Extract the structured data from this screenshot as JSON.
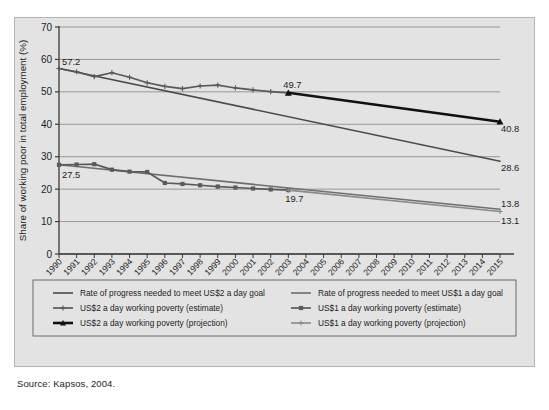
{
  "source_note": "Source: Kapsos, 2004.",
  "chart_data": {
    "type": "line",
    "title": "",
    "xlabel": "",
    "ylabel": "Share of working poor in total employment (%)",
    "xlim": [
      1990,
      2015
    ],
    "ylim": [
      0,
      70
    ],
    "yticks": [
      0,
      10,
      20,
      30,
      40,
      50,
      60,
      70
    ],
    "ytick_labels": [
      "0",
      "10",
      "20",
      "30",
      "40",
      "50",
      "60",
      "70"
    ],
    "grid": "horizontal",
    "legend_position": "below-plot",
    "x": [
      1990,
      1991,
      1992,
      1993,
      1994,
      1995,
      1996,
      1997,
      1998,
      1999,
      2000,
      2001,
      2002,
      2003,
      2004,
      2005,
      2006,
      2007,
      2008,
      2009,
      2010,
      2011,
      2012,
      2013,
      2014,
      2015
    ],
    "xtick_labels": [
      "1990",
      "1991",
      "1992",
      "1993",
      "1994",
      "1995",
      "1996",
      "1997",
      "1998",
      "1999",
      "2000",
      "2001",
      "2002",
      "2003",
      "2004",
      "2005",
      "2006",
      "2007",
      "2008",
      "2009",
      "2010",
      "2011",
      "2012",
      "2013",
      "2014",
      "2015"
    ],
    "series": [
      {
        "name": "Rate of progress needed to meet US$2 a day goal",
        "key": "goal_us2",
        "color": "#4a4a4a",
        "marker": "none",
        "width": 1.6,
        "x": [
          1990,
          2015
        ],
        "values": [
          57.2,
          28.6
        ]
      },
      {
        "name": "Rate of progress needed to meet US$1 a day goal",
        "key": "goal_us1",
        "color": "#6e6e6e",
        "marker": "none",
        "width": 1.6,
        "x": [
          1990,
          2015
        ],
        "values": [
          27.5,
          13.8
        ]
      },
      {
        "name": "US$2 a day working poverty (estimate)",
        "key": "est_us2",
        "color": "#585858",
        "marker": "plus",
        "width": 1.7,
        "x": [
          1990,
          1991,
          1992,
          1993,
          1994,
          1995,
          1996,
          1997,
          1998,
          1999,
          2000,
          2001,
          2002,
          2003
        ],
        "values": [
          57.2,
          56.2,
          54.7,
          55.9,
          54.5,
          52.8,
          51.7,
          51.0,
          51.8,
          52.1,
          51.2,
          50.6,
          50.1,
          49.7
        ]
      },
      {
        "name": "US$2 a day working poverty (projection)",
        "key": "proj_us2",
        "color": "#101010",
        "marker": "triangle",
        "width": 2.6,
        "x": [
          2003,
          2015
        ],
        "values": [
          49.7,
          40.8
        ]
      },
      {
        "name": "US$1 a day working poverty (estimate)",
        "key": "est_us1",
        "color": "#5a5a5a",
        "marker": "square",
        "width": 1.7,
        "x": [
          1990,
          1991,
          1992,
          1993,
          1994,
          1995,
          1996,
          1997,
          1998,
          1999,
          2000,
          2001,
          2002,
          2003
        ],
        "values": [
          27.5,
          27.6,
          27.7,
          26.0,
          25.4,
          25.3,
          21.9,
          21.6,
          21.2,
          20.8,
          20.5,
          20.2,
          19.9,
          19.7
        ]
      },
      {
        "name": "US$1 a day working poverty (projection)",
        "key": "proj_us1",
        "color": "#8a8a8a",
        "marker": "plus",
        "width": 1.6,
        "x": [
          2003,
          2015
        ],
        "values": [
          19.7,
          13.1
        ]
      }
    ],
    "annotations": [
      {
        "text": "57.2",
        "x": 1990,
        "y": 57.2,
        "anchor": "start",
        "dx": 3,
        "dy": -4
      },
      {
        "text": "27.5",
        "x": 1990,
        "y": 27.5,
        "anchor": "start",
        "dx": 3,
        "dy": 13
      },
      {
        "text": "49.7",
        "x": 2003,
        "y": 49.7,
        "anchor": "middle",
        "dx": 4,
        "dy": -5
      },
      {
        "text": "19.7",
        "x": 2003,
        "y": 19.7,
        "anchor": "middle",
        "dx": 6,
        "dy": 12
      },
      {
        "text": "40.8",
        "x": 2015,
        "y": 40.8,
        "anchor": "start",
        "dx": 1,
        "dy": 10
      },
      {
        "text": "28.6",
        "x": 2015,
        "y": 28.6,
        "anchor": "start",
        "dx": 1,
        "dy": 10
      },
      {
        "text": "13.8",
        "x": 2015,
        "y": 13.8,
        "anchor": "start",
        "dx": 1,
        "dy": -2
      },
      {
        "text": "13.1",
        "x": 2015,
        "y": 13.1,
        "anchor": "start",
        "dx": 1,
        "dy": 12
      }
    ],
    "legend": [
      {
        "label": "Rate of progress needed to meet US$2 a day goal",
        "key": "goal_us2",
        "column": 0,
        "row": 0
      },
      {
        "label": "US$2 a day working poverty (estimate)",
        "key": "est_us2",
        "column": 0,
        "row": 1
      },
      {
        "label": "US$2 a day working poverty (projection)",
        "key": "proj_us2",
        "column": 0,
        "row": 2
      },
      {
        "label": "Rate of progress needed to meet US$1 a day goal",
        "key": "goal_us1",
        "column": 1,
        "row": 0
      },
      {
        "label": "US$1 a day working poverty (estimate)",
        "key": "est_us1",
        "column": 1,
        "row": 1
      },
      {
        "label": "US$1 a day working poverty (projection)",
        "key": "proj_us1",
        "column": 1,
        "row": 2
      }
    ]
  }
}
